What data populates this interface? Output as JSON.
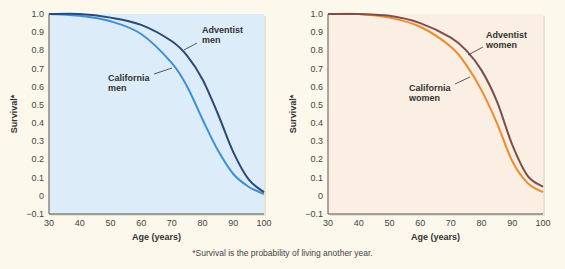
{
  "chart_data": [
    {
      "type": "line",
      "title": "",
      "xlabel": "Age (years)",
      "ylabel": "Survival*",
      "xlim": [
        30,
        100
      ],
      "ylim": [
        -0.1,
        1.0
      ],
      "xticks": [
        30,
        40,
        50,
        60,
        70,
        80,
        90,
        100
      ],
      "yticks": [
        "-0.1",
        "0",
        "0.1",
        "0.2",
        "0.3",
        "0.4",
        "0.5",
        "0.6",
        "0.7",
        "0.8",
        "0.9",
        "1.0"
      ],
      "grid": false,
      "background": "#dcecf9",
      "x": [
        30,
        40,
        50,
        60,
        70,
        75,
        80,
        85,
        90,
        95,
        100
      ],
      "series": [
        {
          "name": "California men",
          "label_lines": [
            "California",
            "men"
          ],
          "color": "#3f8fd8",
          "values": [
            1.0,
            0.99,
            0.96,
            0.89,
            0.73,
            0.6,
            0.42,
            0.25,
            0.12,
            0.05,
            0.01
          ]
        },
        {
          "name": "Adventist men",
          "label_lines": [
            "Adventist",
            "men"
          ],
          "color": "#2c4a78",
          "values": [
            1.0,
            1.0,
            0.98,
            0.94,
            0.85,
            0.77,
            0.64,
            0.45,
            0.24,
            0.09,
            0.02
          ]
        }
      ]
    },
    {
      "type": "line",
      "title": "",
      "xlabel": "Age (years)",
      "ylabel": "Survival*",
      "xlim": [
        30,
        100
      ],
      "ylim": [
        -0.1,
        1.0
      ],
      "xticks": [
        30,
        40,
        50,
        60,
        70,
        80,
        90,
        100
      ],
      "yticks": [
        "-0.1",
        "0",
        "0.1",
        "0.2",
        "0.3",
        "0.4",
        "0.5",
        "0.6",
        "0.7",
        "0.8",
        "0.9",
        "1.0"
      ],
      "grid": false,
      "background": "#fbeee3",
      "x": [
        30,
        40,
        50,
        60,
        70,
        75,
        80,
        85,
        90,
        95,
        100
      ],
      "series": [
        {
          "name": "California women",
          "label_lines": [
            "California",
            "women"
          ],
          "color": "#f08a2c",
          "values": [
            1.0,
            1.0,
            0.98,
            0.93,
            0.82,
            0.72,
            0.58,
            0.4,
            0.19,
            0.07,
            0.02
          ]
        },
        {
          "name": "Adventist women",
          "label_lines": [
            "Adventist",
            "women"
          ],
          "color": "#7d4f4a",
          "values": [
            1.0,
            1.0,
            0.99,
            0.95,
            0.87,
            0.8,
            0.69,
            0.52,
            0.28,
            0.11,
            0.05
          ]
        }
      ]
    }
  ],
  "footnote": "*Survival is the probability of living another year."
}
